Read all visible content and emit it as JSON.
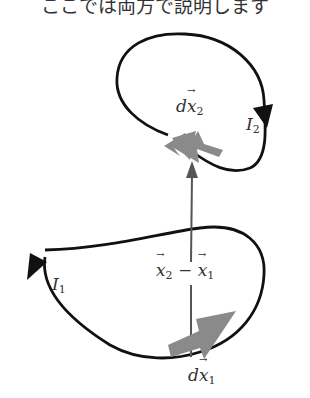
{
  "caption": "ここでは両方で説明します",
  "labels": {
    "dx2": {
      "base": "d",
      "var": "x",
      "sub": "2"
    },
    "I2": {
      "var": "I",
      "sub": "2"
    },
    "I1": {
      "var": "I",
      "sub": "1"
    },
    "diff": {
      "a": "x",
      "a_sub": "2",
      "op": " − ",
      "b": "x",
      "b_sub": "1"
    },
    "dx1": {
      "base": "d",
      "var": "x",
      "sub": "1"
    }
  },
  "colors": {
    "loop": "#111111",
    "element_arrow": "#8a8a8a",
    "vector": "#555555",
    "text": "#333333"
  }
}
